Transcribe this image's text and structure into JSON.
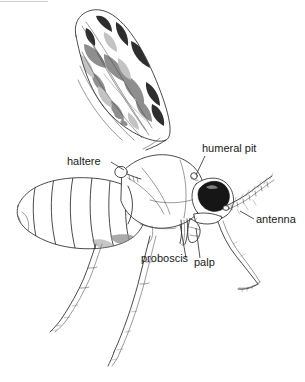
{
  "figure": {
    "background_color": "#ffffff",
    "ink_color": "#2b2b2b",
    "label_color": "#1a1a1a",
    "eye_color": "#161616",
    "wing_patch_color": "#2e2e2e",
    "width": 305,
    "height": 382
  },
  "labels": [
    {
      "id": "haltere",
      "text": "haltere",
      "text_x": 67,
      "text_y": 165,
      "anchor": "start",
      "leader": "M 111 162 L 124 170",
      "target": "knobbed haltere behind thorax"
    },
    {
      "id": "humeral-pit",
      "text": "humeral pit",
      "text_y": 152,
      "text_x": 202,
      "anchor": "start",
      "leader": "M 205 156 L 196 175",
      "target": "humeral pit on thorax"
    },
    {
      "id": "antenna",
      "text": "antenna",
      "text_x": 256,
      "text_y": 223,
      "anchor": "start",
      "leader": "M 254 219 L 240 211",
      "target": "segmented antenna of head"
    },
    {
      "id": "proboscis",
      "text": "proboscis",
      "text_x": 141,
      "text_y": 262,
      "anchor": "start",
      "leader": "M 186 258 L 180 224",
      "target": "piercing proboscis below head"
    },
    {
      "id": "palp",
      "text": "palp",
      "text_x": 194,
      "text_y": 266,
      "anchor": "start",
      "leader": "M 200 258 L 196 228",
      "target": "maxillary palp"
    }
  ],
  "anatomy_parts": [
    "wing",
    "haltere",
    "thorax",
    "humeral pit",
    "abdomen",
    "head",
    "compound eye",
    "antenna",
    "proboscis",
    "palp",
    "foreleg",
    "midleg",
    "hindleg"
  ]
}
